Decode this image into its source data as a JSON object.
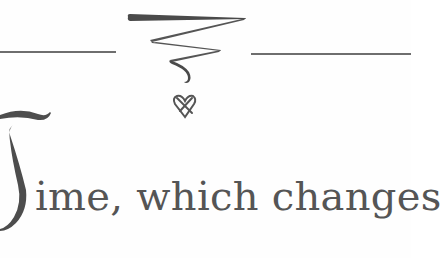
{
  "document": {
    "drop_cap": "T",
    "opening_line": "ime, which changes",
    "full_opening": "Time, which changes"
  },
  "ornament": {
    "type": "zigzag-flourish-with-heart",
    "icons": [
      "flourish-icon",
      "heart-knot-icon"
    ]
  },
  "colors": {
    "ink": "#555555",
    "rule": "#6e6e6e",
    "background": "#fefefe"
  }
}
